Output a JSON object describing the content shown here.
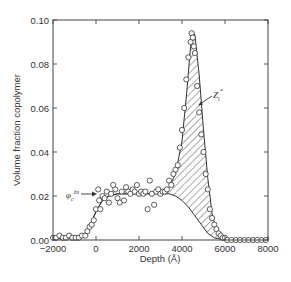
{
  "chart_data": {
    "type": "scatter",
    "title": "",
    "xlabel": "Depth (Å)",
    "ylabel": "Volume fraction copolymer",
    "xlim": [
      -2000,
      8000
    ],
    "ylim": [
      0,
      0.1
    ],
    "xticks": [
      -2000,
      0,
      2000,
      4000,
      6000,
      8000
    ],
    "xtick_labels": [
      "−2000",
      "0",
      "2000",
      "4000",
      "6000",
      "8000"
    ],
    "yticks": [
      0,
      0.02,
      0.04,
      0.06,
      0.08,
      0.1
    ],
    "ytick_labels": [
      "0.00",
      "0.02",
      "0.04",
      "0.06",
      "0.08",
      "0.10"
    ],
    "grid": false,
    "legend": null,
    "annotations": [
      {
        "text": "φc^bs",
        "x": -800,
        "y": 0.021,
        "arrow_to": [
          0,
          0.021
        ]
      },
      {
        "text": "Zi*",
        "x": 5500,
        "y": 0.062,
        "arrow_to": [
          4700,
          0.055
        ]
      }
    ],
    "series": [
      {
        "name": "data points (open circles)",
        "type": "scatter",
        "x": [
          -2000,
          -1850,
          -1700,
          -1550,
          -1400,
          -1250,
          -1100,
          -950,
          -800,
          -650,
          -500,
          -400,
          -300,
          -200,
          -100,
          0,
          100,
          150,
          200,
          300,
          400,
          500,
          600,
          700,
          800,
          900,
          1000,
          1100,
          1200,
          1300,
          1400,
          1500,
          1600,
          1700,
          1800,
          1900,
          2000,
          2100,
          2200,
          2300,
          2400,
          2500,
          2600,
          2700,
          2800,
          2900,
          3000,
          3100,
          3200,
          3300,
          3400,
          3500,
          3600,
          3700,
          3800,
          3900,
          4000,
          4100,
          4200,
          4300,
          4400,
          4450,
          4500,
          4550,
          4600,
          4700,
          4800,
          4900,
          5000,
          5100,
          5200,
          5300,
          5400,
          5500,
          5600,
          5700,
          5800,
          5900,
          6000,
          6100,
          6300,
          6500,
          6700,
          6900,
          7100,
          7300,
          7500,
          7700,
          7900
        ],
        "y": [
          0.001,
          0.001,
          0.002,
          0.001,
          0.001,
          0.002,
          0.001,
          0.001,
          0.001,
          0.002,
          0.002,
          0.004,
          0.006,
          0.007,
          0.009,
          0.014,
          0.023,
          0.018,
          0.014,
          0.02,
          0.019,
          0.022,
          0.017,
          0.021,
          0.025,
          0.023,
          0.019,
          0.017,
          0.022,
          0.018,
          0.024,
          0.022,
          0.021,
          0.023,
          0.022,
          0.025,
          0.021,
          0.022,
          0.021,
          0.022,
          0.014,
          0.027,
          0.021,
          0.016,
          0.022,
          0.023,
          0.021,
          0.022,
          0.022,
          0.023,
          0.027,
          0.025,
          0.03,
          0.032,
          0.034,
          0.042,
          0.05,
          0.06,
          0.073,
          0.083,
          0.09,
          0.094,
          0.092,
          0.088,
          0.085,
          0.07,
          0.058,
          0.048,
          0.04,
          0.03,
          0.023,
          0.014,
          0.01,
          0.007,
          0.005,
          0.003,
          0.002,
          0.001,
          0.001,
          0.0,
          0.0,
          0.0,
          0.0,
          0.0,
          0.0,
          0.0,
          0.0,
          0.0,
          0.0
        ]
      },
      {
        "name": "fit profile (total)",
        "type": "line",
        "x": [
          -2000,
          -1000,
          -600,
          -300,
          0,
          300,
          600,
          1000,
          1500,
          2000,
          2500,
          3000,
          3400,
          3700,
          4000,
          4200,
          4400,
          4500,
          4600,
          4800,
          5000,
          5200,
          5400,
          5600,
          5800,
          6000,
          6200,
          8000
        ],
        "y": [
          0.0005,
          0.001,
          0.002,
          0.006,
          0.013,
          0.018,
          0.02,
          0.021,
          0.021,
          0.021,
          0.021,
          0.022,
          0.024,
          0.03,
          0.045,
          0.065,
          0.088,
          0.095,
          0.093,
          0.075,
          0.05,
          0.028,
          0.012,
          0.004,
          0.001,
          0.0003,
          0.0,
          0.0
        ]
      },
      {
        "name": "bulk baseline φc^bs",
        "type": "line",
        "x": [
          -2000,
          -1000,
          -600,
          -300,
          0,
          300,
          600,
          1000,
          1500,
          2000,
          2500,
          3000,
          3400,
          3700,
          4000,
          4300,
          4600,
          4900,
          5200,
          5500,
          5800,
          6200,
          8000
        ],
        "y": [
          0.0005,
          0.001,
          0.002,
          0.006,
          0.013,
          0.018,
          0.02,
          0.021,
          0.021,
          0.021,
          0.021,
          0.021,
          0.021,
          0.02,
          0.018,
          0.015,
          0.011,
          0.007,
          0.003,
          0.001,
          0.0003,
          0.0,
          0.0
        ]
      }
    ],
    "shaded_region": {
      "name": "Zi* (surface excess)",
      "between": [
        "fit profile (total)",
        "bulk baseline φc^bs"
      ],
      "pattern": "diagonal-hatch"
    }
  },
  "labels": {
    "xlabel": "Depth (Å)",
    "ylabel": "Volume fraction copolymer",
    "phi_main": "φ",
    "phi_sub": "c",
    "phi_sup": "bs",
    "z_main": "Z",
    "z_sub": "i",
    "z_sup": "*"
  }
}
